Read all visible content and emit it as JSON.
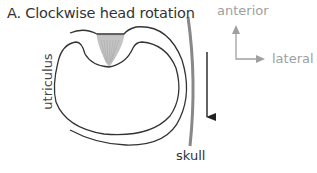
{
  "figure": {
    "title": "A. Clockwise head rotation",
    "labels": {
      "utriculus": "utriculus",
      "skull": "skull",
      "anterior": "anterior",
      "lateral": "lateral"
    },
    "colors": {
      "outline": "#333333",
      "skull": "#888888",
      "hair_bundle": "#bdbdbd",
      "axis": "#a0a0a0",
      "rotation_arrow": "#222222"
    },
    "elements": [
      {
        "name": "utriculus-outline",
        "type": "curve"
      },
      {
        "name": "hair-bundle",
        "type": "shape"
      },
      {
        "name": "skull-wall",
        "type": "line"
      },
      {
        "name": "rotation-arrow",
        "type": "arrow",
        "direction": "down"
      },
      {
        "name": "orientation-axes",
        "type": "axes",
        "axes": [
          "anterior",
          "lateral"
        ]
      }
    ]
  }
}
